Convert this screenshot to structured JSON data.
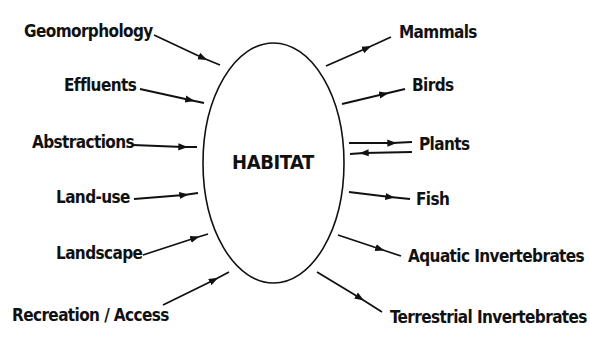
{
  "diagram": {
    "center": {
      "label": "HABITAT"
    },
    "inputs": [
      {
        "label": "Geomorphology"
      },
      {
        "label": "Effluents"
      },
      {
        "label": "Abstractions"
      },
      {
        "label": "Land-use"
      },
      {
        "label": "Landscape"
      },
      {
        "label": "Recreation / Access"
      }
    ],
    "outputs": [
      {
        "label": "Mammals",
        "direction": "out"
      },
      {
        "label": "Birds",
        "direction": "out"
      },
      {
        "label": "Plants",
        "direction": "both"
      },
      {
        "label": "Fish",
        "direction": "out"
      },
      {
        "label": "Aquatic Invertebrates",
        "direction": "out"
      },
      {
        "label": "Terrestrial Invertebrates",
        "direction": "out"
      }
    ],
    "colors": {
      "stroke": "#111111",
      "background": "#ffffff"
    }
  }
}
